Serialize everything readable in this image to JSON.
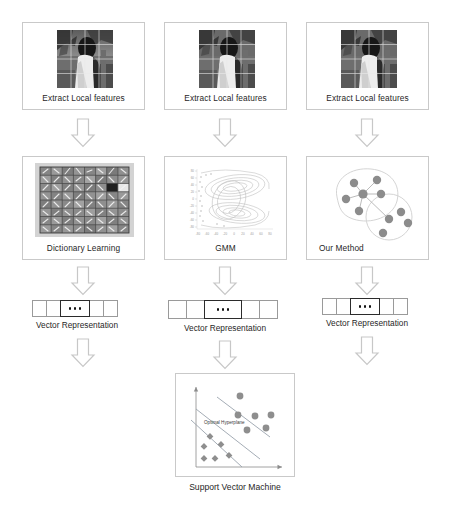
{
  "diagram": {
    "columns": [
      {
        "id": "dictionary-learning",
        "stage1_label": "Extract Local features",
        "stage2_label": "Dictionary Learning",
        "stage3_label": "Vector Representation"
      },
      {
        "id": "gmm",
        "stage1_label": "Extract Local features",
        "stage2_label": "GMM",
        "stage3_label": "Vector Representation"
      },
      {
        "id": "our-method",
        "stage1_label": "Extract Local features",
        "stage2_label": "Our Method",
        "stage3_label": "Vector Representation"
      }
    ],
    "classifier": {
      "label": "Support Vector Machine",
      "annotation": "Optimal Hyperplane"
    },
    "vector": {
      "cell_count": 6,
      "ellipsis_cell_index": 3,
      "ellipsis_dots": 3
    },
    "colors": {
      "box_border": "#c9c9c9",
      "arrow_stroke": "#c7c7c7",
      "arrow_fill": "#ffffff",
      "text": "#1f1f1f",
      "vector_cell_border": "#9a9a9a",
      "vector_dots_border": "#2b2b2b",
      "cluster_node": "#8c8c8c",
      "svm_point": "#8e8e8e",
      "svm_line": "#9aa3ad",
      "gmm_contour": "#b9b9b9"
    },
    "grid_overlay": {
      "photo_rows": 4,
      "photo_cols": 4,
      "dictionary_rows": 8,
      "dictionary_cols": 8
    },
    "gmm_axes": {
      "x_ticks": [
        "-80",
        "-60",
        "-40",
        "-20",
        "0",
        "20",
        "40",
        "60",
        "80"
      ],
      "y_ticks": [
        "80",
        "60",
        "40",
        "20",
        "0",
        "-20",
        "-40",
        "-60",
        "-80"
      ]
    },
    "our_method": {
      "cluster_count": 2,
      "cluster_a_nodes": 6,
      "cluster_b_nodes": 5
    },
    "svm_plot": {
      "class_a_marker": "circle",
      "class_a_count": 7,
      "class_b_marker": "diamond",
      "class_b_count": 7,
      "line_count": 3
    }
  }
}
